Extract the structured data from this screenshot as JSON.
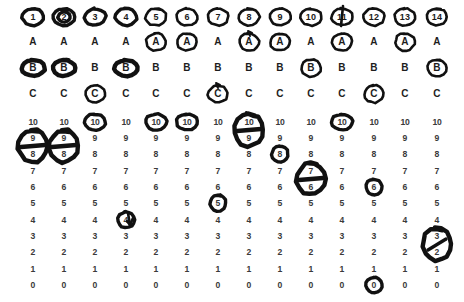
{
  "document": {
    "title": "Scanned rating sheet with hand-drawn circle marks",
    "background_color": "#ffffff",
    "ink_color": "#111111",
    "print_color": "#2b2b2b"
  },
  "layout": {
    "column_centers_x": [
      33,
      64,
      95,
      126,
      156,
      187,
      218,
      249,
      280,
      311,
      342,
      374,
      405,
      437
    ],
    "letter_rows_y": {
      "A": 42,
      "B": 68,
      "C": 94
    },
    "header_row_y": 17,
    "number_rows_y": [
      122,
      138,
      154,
      171,
      187,
      203,
      220,
      236,
      252,
      269,
      285
    ]
  },
  "header": {
    "row_label": "item-number",
    "values": [
      "1",
      "2",
      "3",
      "4",
      "5",
      "6",
      "7",
      "8",
      "9",
      "10",
      "11",
      "12",
      "13",
      "14"
    ],
    "circled": [
      true,
      true,
      true,
      true,
      true,
      true,
      true,
      true,
      true,
      true,
      true,
      true,
      true,
      true
    ]
  },
  "letter_block": {
    "row_labels": [
      "A",
      "B",
      "C"
    ],
    "rows": [
      {
        "label": "A",
        "values": [
          "A",
          "A",
          "A",
          "A",
          "A",
          "A",
          "A",
          "A",
          "A",
          "A",
          "A",
          "A",
          "A",
          "A"
        ],
        "circled_columns": [
          5,
          6,
          8,
          9,
          11,
          13
        ]
      },
      {
        "label": "B",
        "values": [
          "B",
          "B",
          "B",
          "B",
          "B",
          "B",
          "B",
          "B",
          "B",
          "B",
          "B",
          "B",
          "B",
          "B"
        ],
        "circled_columns": [
          1,
          2,
          4,
          10,
          14
        ]
      },
      {
        "label": "C",
        "values": [
          "C",
          "C",
          "C",
          "C",
          "C",
          "C",
          "C",
          "C",
          "C",
          "C",
          "C",
          "C",
          "C",
          "C"
        ],
        "circled_columns": [
          3,
          7,
          12
        ]
      }
    ]
  },
  "number_block": {
    "scale_values": [
      "10",
      "9",
      "8",
      "7",
      "6",
      "5",
      "4",
      "3",
      "2",
      "1",
      "0"
    ],
    "columns": [
      {
        "column": 1,
        "single_circles": [],
        "span_ovals": [
          {
            "from": "9",
            "to": "8",
            "strike": "horizontal"
          }
        ]
      },
      {
        "column": 2,
        "single_circles": [],
        "span_ovals": [
          {
            "from": "9",
            "to": "8",
            "strike": "horizontal"
          }
        ]
      },
      {
        "column": 3,
        "single_circles": [
          "10"
        ],
        "span_ovals": []
      },
      {
        "column": 4,
        "single_circles": [
          "4"
        ],
        "span_ovals": [],
        "extra_glyph": "check-arrow"
      },
      {
        "column": 5,
        "single_circles": [
          "10"
        ],
        "span_ovals": []
      },
      {
        "column": 6,
        "single_circles": [
          "10"
        ],
        "span_ovals": []
      },
      {
        "column": 7,
        "single_circles": [
          "5"
        ],
        "span_ovals": []
      },
      {
        "column": 8,
        "single_circles": [],
        "span_ovals": [
          {
            "from": "10",
            "to": "9",
            "strike": "horizontal"
          }
        ]
      },
      {
        "column": 9,
        "single_circles": [
          "8"
        ],
        "span_ovals": []
      },
      {
        "column": 10,
        "single_circles": [],
        "span_ovals": [
          {
            "from": "7",
            "to": "6",
            "strike": "horizontal"
          }
        ]
      },
      {
        "column": 11,
        "single_circles": [
          "10"
        ],
        "span_ovals": []
      },
      {
        "column": 12,
        "single_circles": [
          "6",
          "0"
        ],
        "span_ovals": []
      },
      {
        "column": 13,
        "single_circles": [],
        "span_ovals": []
      },
      {
        "column": 14,
        "single_circles": [],
        "span_ovals": [
          {
            "from": "3",
            "to": "2",
            "strike": "diagonal"
          }
        ]
      }
    ]
  }
}
